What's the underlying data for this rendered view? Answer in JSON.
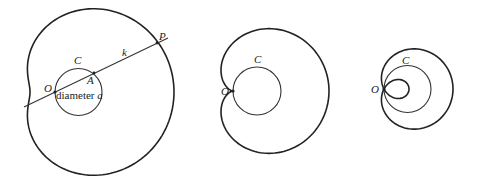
{
  "figures": [
    {
      "name": "limacon-dimpled",
      "origin": [
        55,
        92
      ],
      "a": 47,
      "k": 72,
      "circle_label": "C",
      "origin_label": "O",
      "point_A_label": "A",
      "point_P_label": "P",
      "line_label": "k",
      "diameter_label": "diameter",
      "diameter_var": "a"
    },
    {
      "name": "cardioid",
      "origin": [
        233,
        91
      ],
      "a": 48,
      "k": 48,
      "circle_label": "C",
      "origin_label": "O"
    },
    {
      "name": "limacon-inner-loop",
      "origin": [
        384,
        89
      ],
      "a": 47,
      "k": 22,
      "circle_label": "C",
      "origin_label": "O"
    }
  ],
  "colors": {
    "stroke": "#222222",
    "background": "#ffffff"
  }
}
